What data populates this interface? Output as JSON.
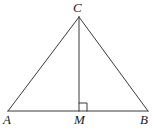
{
  "figure": {
    "kind": "geometry-diagram",
    "canvas": {
      "width": 158,
      "height": 130
    },
    "colors": {
      "background": "#ffffff",
      "stroke": "#3a3a3a",
      "label": "#1a1a1a"
    },
    "stroke_width": 1,
    "labels": {
      "apex": "C",
      "left_vertex": "A",
      "foot": "M",
      "right_vertex": "B"
    },
    "points": {
      "C": {
        "x": 79,
        "y": 17
      },
      "A": {
        "x": 8,
        "y": 111
      },
      "M": {
        "x": 79,
        "y": 111
      },
      "B": {
        "x": 148,
        "y": 111
      }
    },
    "segments": [
      {
        "name": "side-AC",
        "from": "A",
        "to": "C"
      },
      {
        "name": "side-CB",
        "from": "C",
        "to": "B"
      },
      {
        "name": "base-AB",
        "from": "A",
        "to": "B"
      },
      {
        "name": "altitude-CM",
        "from": "C",
        "to": "M"
      }
    ],
    "right_angle_marker": {
      "at": "M",
      "side": "right",
      "size": 8,
      "x": 79,
      "y": 103
    }
  }
}
